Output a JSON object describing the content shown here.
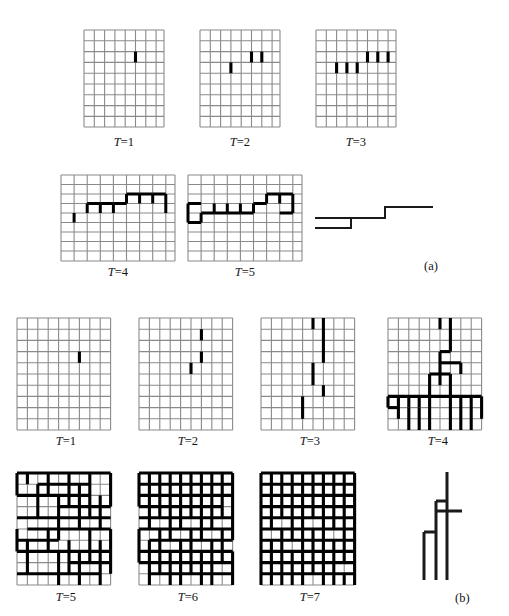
{
  "figure": {
    "type": "lattice-growth-diagram",
    "panels": [
      {
        "id": "a",
        "letter_label": "(a)",
        "grid_cols": 8,
        "grid_rows": 9,
        "frames": [
          {
            "label_prefix": "T",
            "label_sep": "=",
            "label_value": "1",
            "name": "t1"
          },
          {
            "label_prefix": "T",
            "label_sep": "=",
            "label_value": "2",
            "name": "t2"
          },
          {
            "label_prefix": "T",
            "label_sep": "=",
            "label_value": "3",
            "name": "t3"
          },
          {
            "label_prefix": "T",
            "label_sep": "=",
            "label_value": "4",
            "name": "t4"
          },
          {
            "label_prefix": "T",
            "label_sep": "=",
            "label_value": "5",
            "name": "t5"
          }
        ],
        "result_shape": "staircase-path"
      },
      {
        "id": "b",
        "letter_label": "(b)",
        "grid_cols": 9,
        "grid_rows": 10,
        "frames": [
          {
            "label_prefix": "T",
            "label_sep": "=",
            "label_value": "1",
            "name": "t1"
          },
          {
            "label_prefix": "T",
            "label_sep": "=",
            "label_value": "2",
            "name": "t2"
          },
          {
            "label_prefix": "T",
            "label_sep": "=",
            "label_value": "3",
            "name": "t3"
          },
          {
            "label_prefix": "T",
            "label_sep": "=",
            "label_value": "4",
            "name": "t4"
          },
          {
            "label_prefix": "T",
            "label_sep": "=",
            "label_value": "5",
            "name": "t5"
          },
          {
            "label_prefix": "T",
            "label_sep": "=",
            "label_value": "6",
            "name": "t6"
          },
          {
            "label_prefix": "T",
            "label_sep": "=",
            "label_value": "7",
            "name": "t7"
          }
        ],
        "result_shape": "tree-path"
      }
    ],
    "colors": {
      "lattice_line": "#8a8a8a",
      "occupied_bond": "#000000",
      "background": "#ffffff",
      "text": "#141414"
    }
  },
  "labels": {
    "a_t1": "T=1",
    "a_t2": "T=2",
    "a_t3": "T=3",
    "a_t4": "T=4",
    "a_t5": "T=5",
    "b_t1": "T=1",
    "b_t2": "T=2",
    "b_t3": "T=3",
    "b_t4": "T=4",
    "b_t5": "T=5",
    "b_t6": "T=6",
    "b_t7": "T=7",
    "panel_a": "(a)",
    "panel_b": "(b)"
  },
  "bonds": {
    "a_t1": {
      "v": [
        [
          5,
          3
        ]
      ],
      "h": []
    },
    "a_t2": {
      "v": [
        [
          3,
          4
        ],
        [
          5,
          3
        ],
        [
          6,
          3
        ]
      ],
      "h": []
    },
    "a_t3": {
      "v": [
        [
          2,
          4
        ],
        [
          3,
          4
        ],
        [
          4,
          4
        ],
        [
          5,
          3
        ],
        [
          6,
          3
        ],
        [
          7,
          3
        ]
      ],
      "h": []
    },
    "a_t4": {
      "v": [
        [
          0,
          5
        ],
        [
          1,
          4
        ],
        [
          2,
          4
        ],
        [
          3,
          4
        ],
        [
          4,
          3
        ],
        [
          5,
          3
        ],
        [
          6,
          3
        ],
        [
          7,
          3
        ],
        [
          8,
          3
        ]
      ],
      "h": [
        [
          1,
          4
        ],
        [
          2,
          4
        ],
        [
          3,
          4
        ],
        [
          4,
          3
        ],
        [
          5,
          3
        ],
        [
          6,
          3
        ],
        [
          7,
          3
        ],
        [
          1,
          5
        ],
        [
          0,
          5
        ]
      ]
    },
    "a_t5": {
      "v": [
        [
          0,
          4
        ],
        [
          0,
          5
        ],
        [
          1,
          4
        ],
        [
          1,
          5
        ],
        [
          2,
          4
        ],
        [
          3,
          4
        ],
        [
          4,
          4
        ],
        [
          5,
          3
        ],
        [
          6,
          3
        ],
        [
          7,
          3
        ],
        [
          8,
          3
        ]
      ],
      "h": [
        [
          0,
          4
        ],
        [
          1,
          5
        ],
        [
          2,
          4
        ],
        [
          3,
          4
        ],
        [
          4,
          4
        ],
        [
          5,
          3
        ],
        [
          6,
          3
        ],
        [
          7,
          3
        ],
        [
          0,
          5
        ],
        [
          1,
          4
        ]
      ]
    },
    "b_t1": {
      "v": [
        [
          6,
          3
        ]
      ],
      "h": []
    },
    "b_t2": {
      "v": [
        [
          5,
          4
        ],
        [
          6,
          1
        ],
        [
          6,
          3
        ]
      ],
      "h": []
    },
    "b_t3": {
      "v": [
        [
          4,
          7
        ],
        [
          5,
          4
        ],
        [
          5,
          5
        ],
        [
          6,
          0
        ],
        [
          6,
          1
        ],
        [
          6,
          2
        ],
        [
          6,
          3
        ],
        [
          5,
          0
        ]
      ],
      "h": []
    },
    "b_t4": {
      "v": [
        [
          5,
          0
        ],
        [
          6,
          0
        ],
        [
          6,
          1
        ],
        [
          6,
          2
        ],
        [
          6,
          3
        ],
        [
          5,
          3
        ],
        [
          5,
          4
        ],
        [
          5,
          5
        ],
        [
          5,
          6
        ],
        [
          4,
          6
        ],
        [
          4,
          7
        ],
        [
          4,
          8
        ],
        [
          5,
          7
        ],
        [
          5,
          8
        ],
        [
          6,
          7
        ],
        [
          7,
          8
        ],
        [
          8,
          8
        ],
        [
          1,
          8
        ],
        [
          2,
          8
        ],
        [
          3,
          8
        ],
        [
          0,
          7
        ],
        [
          1,
          7
        ]
      ],
      "h": [
        [
          5,
          3
        ],
        [
          4,
          6
        ],
        [
          6,
          5
        ],
        [
          0,
          7
        ],
        [
          1,
          7
        ],
        [
          2,
          7
        ],
        [
          3,
          7
        ],
        [
          4,
          7
        ],
        [
          5,
          7
        ],
        [
          6,
          7
        ],
        [
          7,
          7
        ],
        [
          1,
          8
        ]
      ]
    }
  },
  "curves": {
    "a_result": "staircase profile: low-left plateau stepping up to high-right plateau",
    "b_result": "branching tree: three vertical prongs joined by two short crossbars"
  }
}
